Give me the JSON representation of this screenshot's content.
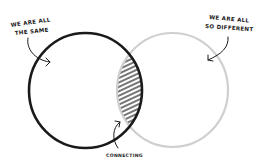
{
  "diagram": {
    "type": "venn",
    "colors": {
      "left_circle": "#1a1a1a",
      "right_circle": "#cfcfcf",
      "hatch": "#2a2a2a",
      "background": "#ffffff"
    },
    "left": {
      "label_line1": "WE ARE ALL",
      "label_line2": "THE SAME"
    },
    "right": {
      "label_line1": "WE ARE ALL",
      "label_line2": "SO DIFFERENT"
    },
    "intersection": {
      "label": "CONNECTING"
    }
  }
}
